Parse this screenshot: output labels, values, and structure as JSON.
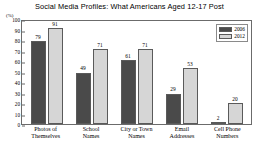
{
  "chart_data": {
    "type": "bar",
    "title": "Social Media Profiles: What Americans Aged 12-17 Post",
    "xlabel": "",
    "ylabel": "(%)",
    "ylim": [
      0,
      100
    ],
    "ytick_step": 10,
    "grid": false,
    "legend_position": "top-right",
    "categories": [
      "Photos of Themselves",
      "School Names",
      "City or Town Names",
      "Email Addresses",
      "Cell Phone Numbers"
    ],
    "category_lines": [
      [
        "Photos of",
        "Themselves"
      ],
      [
        "School",
        "Names"
      ],
      [
        "City or Town",
        "Names"
      ],
      [
        "Email",
        "Addresses"
      ],
      [
        "Cell Phone",
        "Numbers"
      ]
    ],
    "yticks": [
      "0",
      "10",
      "20",
      "30",
      "40",
      "50",
      "60",
      "70",
      "80",
      "90",
      "100"
    ],
    "series": [
      {
        "name": "2006",
        "color": "#4a4a4a",
        "values": [
          79,
          49,
          61,
          29,
          2
        ]
      },
      {
        "name": "2012",
        "color": "#d6d6d6",
        "values": [
          91,
          71,
          71,
          53,
          20
        ]
      }
    ]
  },
  "legend": {
    "items": [
      {
        "label": "2006"
      },
      {
        "label": "2012"
      }
    ]
  }
}
